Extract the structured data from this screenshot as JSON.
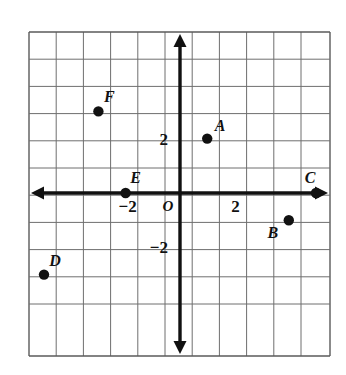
{
  "figure": {
    "background_color": "#ffffff",
    "grid_color": "#6e6e6e",
    "axis_color": "#111111",
    "point_color": "#111111"
  },
  "chart_data": {
    "type": "scatter",
    "title": "",
    "xlabel": "",
    "ylabel": "",
    "xlim": [
      -5.6,
      5.6
    ],
    "ylim": [
      -5.9,
      6.1
    ],
    "grid": true,
    "gridlines_every": 1,
    "legend": "none",
    "axis_arrows": [
      "left",
      "right",
      "up",
      "down"
    ],
    "x_tick_labels": [
      {
        "value": -2,
        "text": "−2"
      },
      {
        "value": 2,
        "text": "2"
      }
    ],
    "y_tick_labels": [
      {
        "value": 2,
        "text": "2"
      },
      {
        "value": -2,
        "text": "−2"
      }
    ],
    "origin_label": "O",
    "points": [
      {
        "label": "A",
        "x": 1,
        "y": 2,
        "label_dx": 13,
        "label_dy": -8
      },
      {
        "label": "B",
        "x": 4,
        "y": -1,
        "label_dx": -16,
        "label_dy": 18
      },
      {
        "label": "C",
        "x": 5,
        "y": 0,
        "label_dx": -6,
        "label_dy": -10
      },
      {
        "label": "D",
        "x": -5,
        "y": -3,
        "label_dx": 11,
        "label_dy": -9
      },
      {
        "label": "E",
        "x": -2,
        "y": 0,
        "label_dx": 10,
        "label_dy": -10
      },
      {
        "label": "F",
        "x": -3,
        "y": 3,
        "label_dx": 11,
        "label_dy": -9
      }
    ]
  }
}
